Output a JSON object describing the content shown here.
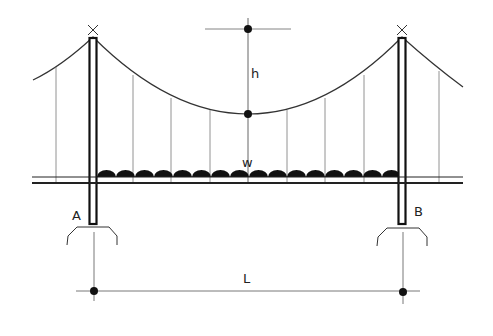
{
  "diagram": {
    "type": "suspension-bridge-schematic",
    "labels": {
      "sag": "h",
      "load": "w",
      "left_support": "A",
      "right_support": "B",
      "span": "L"
    },
    "elements": {
      "towers": [
        "left-tower",
        "right-tower"
      ],
      "main_cable": "parabolic-cable",
      "hanger_count": 9,
      "deck": "double-line-deck",
      "distributed_load_bumps": 16
    },
    "colors": {
      "ink": "#1a1a1a",
      "thin_line": "#555555",
      "background": "#ffffff"
    }
  }
}
